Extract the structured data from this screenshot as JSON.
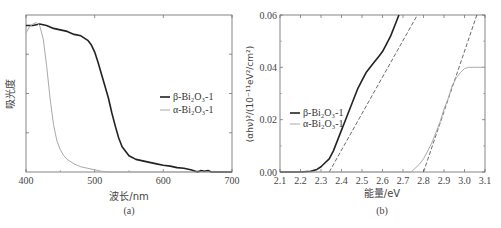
{
  "chart_data": [
    {
      "panel": "(a)",
      "type": "line",
      "xlabel": "波长/nm",
      "ylabel": "吸光度",
      "xlim": [
        400,
        700
      ],
      "ylim": [
        0,
        1
      ],
      "xticks": [
        400,
        500,
        600,
        700
      ],
      "yticks_labeled": false,
      "grid": false,
      "legend_position": "center-right",
      "series": [
        {
          "name": "β-Bi₂O₃-1",
          "color": "#222222",
          "width": 1.6,
          "x": [
            400,
            410,
            420,
            430,
            440,
            450,
            460,
            470,
            480,
            490,
            495,
            500,
            505,
            510,
            515,
            520,
            525,
            530,
            535,
            540,
            550,
            560,
            570,
            580,
            590,
            600,
            610,
            620,
            630,
            640,
            650,
            655,
            660,
            665,
            670,
            680,
            690,
            700
          ],
          "y": [
            0.99,
            0.99,
            1.0,
            0.99,
            0.97,
            0.96,
            0.95,
            0.93,
            0.92,
            0.89,
            0.86,
            0.81,
            0.74,
            0.66,
            0.58,
            0.5,
            0.4,
            0.31,
            0.23,
            0.17,
            0.11,
            0.085,
            0.075,
            0.065,
            0.055,
            0.045,
            0.04,
            0.03,
            0.025,
            0.015,
            0.0,
            0.01,
            0.005,
            0.01,
            0.0,
            0.0,
            0.0,
            0.0
          ]
        },
        {
          "name": "α-Bi₂O₃-1",
          "color": "#aaaaaa",
          "width": 1.0,
          "x": [
            400,
            405,
            410,
            415,
            420,
            425,
            430,
            435,
            440,
            445,
            450,
            455,
            460,
            470,
            480,
            490,
            500,
            510,
            520,
            530,
            550,
            600,
            700
          ],
          "y": [
            0.94,
            0.98,
            1.0,
            1.01,
            0.99,
            0.9,
            0.72,
            0.5,
            0.32,
            0.21,
            0.15,
            0.11,
            0.085,
            0.055,
            0.035,
            0.025,
            0.015,
            0.005,
            0.0,
            0.0,
            0.0,
            0.0,
            0.0
          ]
        }
      ]
    },
    {
      "panel": "(b)",
      "type": "line",
      "xlabel": "能量/eV",
      "ylabel": "(αhν)²/(10⁻¹¹eV²/cm²)",
      "xlim": [
        2.1,
        3.1
      ],
      "ylim": [
        0.0,
        0.06
      ],
      "xticks": [
        2.1,
        2.2,
        2.3,
        2.4,
        2.5,
        2.6,
        2.7,
        2.8,
        2.9,
        3.0,
        3.1
      ],
      "yticks": [
        0.0,
        0.02,
        0.04,
        0.06
      ],
      "grid": false,
      "legend_position": "center-left",
      "series": [
        {
          "name": "β-Bi₂O₃-1",
          "color": "#222222",
          "width": 1.6,
          "x": [
            2.1,
            2.2,
            2.25,
            2.28,
            2.3,
            2.32,
            2.34,
            2.36,
            2.38,
            2.4,
            2.42,
            2.44,
            2.46,
            2.48,
            2.5,
            2.52,
            2.54,
            2.56,
            2.58,
            2.6,
            2.62,
            2.64,
            2.66,
            2.68
          ],
          "y": [
            0.0,
            0.0,
            0.0003,
            0.001,
            0.002,
            0.0035,
            0.005,
            0.008,
            0.012,
            0.016,
            0.02,
            0.024,
            0.028,
            0.032,
            0.035,
            0.038,
            0.04,
            0.042,
            0.044,
            0.046,
            0.049,
            0.052,
            0.056,
            0.06
          ]
        },
        {
          "name": "α-Bi₂O₃-1",
          "color": "#aaaaaa",
          "width": 1.0,
          "x": [
            2.1,
            2.6,
            2.74,
            2.76,
            2.78,
            2.8,
            2.82,
            2.84,
            2.86,
            2.88,
            2.9,
            2.92,
            2.94,
            2.96,
            2.98,
            3.0,
            3.02,
            3.05,
            3.1
          ],
          "y": [
            0.0,
            0.0,
            0.0,
            0.0015,
            0.003,
            0.005,
            0.008,
            0.011,
            0.015,
            0.019,
            0.024,
            0.028,
            0.033,
            0.036,
            0.038,
            0.0395,
            0.04,
            0.04,
            0.04
          ]
        }
      ],
      "tangent_lines": [
        {
          "for": "β-Bi₂O₃-1",
          "style": "dashed",
          "x": [
            2.34,
            2.77
          ],
          "y": [
            0.0,
            0.06
          ],
          "intercept_eV": 2.34
        },
        {
          "for": "α-Bi₂O₃-1",
          "style": "dashed",
          "x": [
            2.8,
            3.06
          ],
          "y": [
            0.0,
            0.06
          ],
          "intercept_eV": 2.8
        }
      ]
    }
  ],
  "captions": {
    "a": "(a)",
    "b": "(b)"
  }
}
